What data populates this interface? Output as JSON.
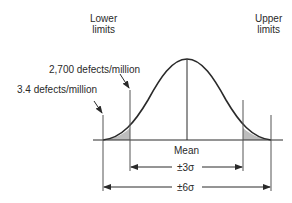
{
  "labels": {
    "lower_limits": [
      "Lower",
      "limits"
    ],
    "upper_limits": [
      "Upper",
      "limits"
    ],
    "defects_2700": "2,700 defects/million",
    "defects_3_4": "3.4 defects/million",
    "mean": "Mean",
    "plus_minus_3sigma": "±3σ",
    "plus_minus_6sigma": "±6σ"
  },
  "colors": {
    "line": "#2a2a2a",
    "shading": "#bdbdbd"
  }
}
